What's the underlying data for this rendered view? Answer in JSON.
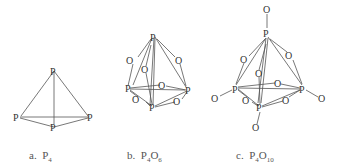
{
  "figures": [
    {
      "label": "a.",
      "formula_base": "P",
      "formula_sub": "4",
      "formula_text": "P4"
    },
    {
      "label": "b.",
      "formula_parts": [
        "P",
        "4",
        "O",
        "6"
      ],
      "formula_text": "P4O6"
    },
    {
      "label": "c.",
      "formula_parts": [
        "P",
        "4",
        "O",
        "10"
      ],
      "formula_text": "P4O10"
    }
  ],
  "atoms": {
    "phosphorus": "P",
    "oxygen": "O"
  },
  "colors": {
    "line": "#555555",
    "text": "#333333",
    "caption": "#555555"
  }
}
